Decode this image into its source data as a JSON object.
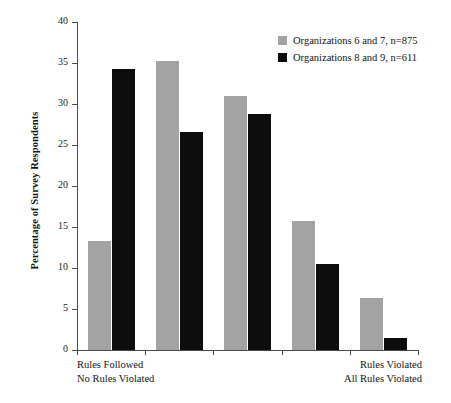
{
  "chart_data": {
    "type": "bar",
    "title": "",
    "xlabel": "",
    "ylabel": "Percentage of Survey Respondents",
    "ylim": [
      0,
      40
    ],
    "yticks": [
      0,
      5,
      10,
      15,
      20,
      25,
      30,
      35,
      40
    ],
    "ytick_labels": [
      "0",
      "5",
      "10",
      "15",
      "20",
      "25",
      "30",
      "35",
      "40"
    ],
    "grid": false,
    "legend_position": "top-right",
    "categories": [
      "1",
      "2",
      "3",
      "4",
      "5"
    ],
    "series": [
      {
        "name": "Organizations 6 and 7, n=875",
        "color": "#a3a3a3",
        "values": [
          13.3,
          35.2,
          31.0,
          15.7,
          6.4
        ]
      },
      {
        "name": "Organizations 8 and 9, n=611",
        "color": "#0d0d0d",
        "values": [
          34.3,
          26.6,
          28.8,
          10.5,
          1.5
        ]
      }
    ],
    "axis_annotations": {
      "left_line1": "Rules Followed",
      "left_line2": "No Rules Violated",
      "right_line1": "Rules Violated",
      "right_line2": "All Rules Violated"
    }
  },
  "legend": {
    "items": [
      {
        "label": "Organizations 6 and 7, n=875",
        "color": "#a3a3a3"
      },
      {
        "label": "Organizations 8 and 9, n=611",
        "color": "#0d0d0d"
      }
    ]
  },
  "colors": {
    "series_a": "#a3a3a3",
    "series_b": "#0d0d0d",
    "axis": "#4a4a4a",
    "background": "#ffffff"
  }
}
